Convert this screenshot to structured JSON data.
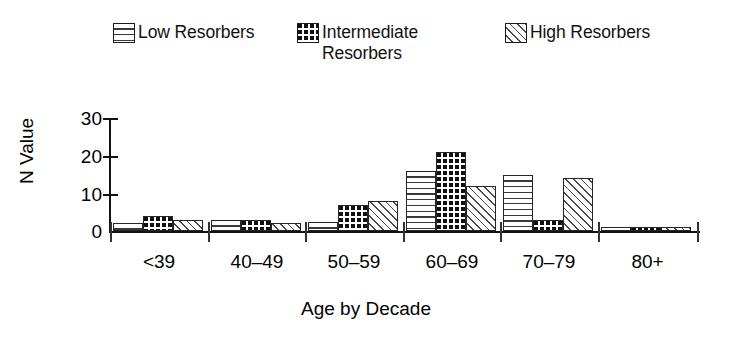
{
  "legend": {
    "items": [
      {
        "label": "Low Resorbers",
        "pattern": "horizontal-lines",
        "color": "#ffffff"
      },
      {
        "label": "Intermediate\nResorbers",
        "pattern": "grid-checker",
        "color": "#111111"
      },
      {
        "label": "High Resorbers",
        "pattern": "diagonal-hatch",
        "color": "#ffffff"
      }
    ]
  },
  "axes": {
    "ylabel": "N Value",
    "xlabel": "Age by Decade",
    "yticks": [
      "30",
      "20",
      "10",
      "0"
    ],
    "xticks": [
      "<39",
      "40–49",
      "50–59",
      "60–69",
      "70–79",
      "80+"
    ]
  },
  "chart_data": {
    "type": "bar",
    "title": "",
    "xlabel": "Age by Decade",
    "ylabel": "N Value",
    "categories": [
      "<39",
      "40–49",
      "50–59",
      "60–69",
      "70–79",
      "80+"
    ],
    "series": [
      {
        "name": "Low Resorbers",
        "values": [
          2,
          3,
          2.5,
          16,
          15,
          1
        ]
      },
      {
        "name": "Intermediate Resorbers",
        "values": [
          4,
          3,
          7,
          21,
          3,
          1
        ]
      },
      {
        "name": "High Resorbers",
        "values": [
          3,
          2,
          8,
          12,
          14,
          1
        ]
      }
    ],
    "ylim": [
      0,
      30
    ],
    "ytick_values": [
      0,
      10,
      20,
      30
    ],
    "grid": false,
    "legend_position": "top"
  }
}
